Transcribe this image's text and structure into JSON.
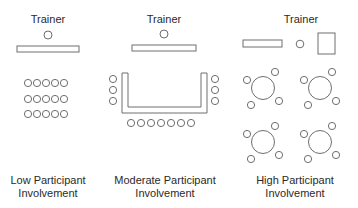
{
  "panels": [
    {
      "id": "low",
      "trainer_label": "Trainer",
      "caption_line1": "Low Participant",
      "caption_line2": "Involvement",
      "layout": "classroom rows",
      "seats": 15
    },
    {
      "id": "moderate",
      "trainer_label": "Trainer",
      "caption_line1": "Moderate Participant",
      "caption_line2": "Involvement",
      "layout": "U-shape",
      "seats": 13
    },
    {
      "id": "high",
      "trainer_label": "Trainer",
      "caption_line1": "High Participant",
      "caption_line2": "Involvement",
      "layout": "round tables",
      "tables": 4,
      "seats_per_table": 4
    }
  ],
  "colors": {
    "stroke": "#6e6e6e",
    "text": "#2a2a2a",
    "background": "#ffffff"
  }
}
